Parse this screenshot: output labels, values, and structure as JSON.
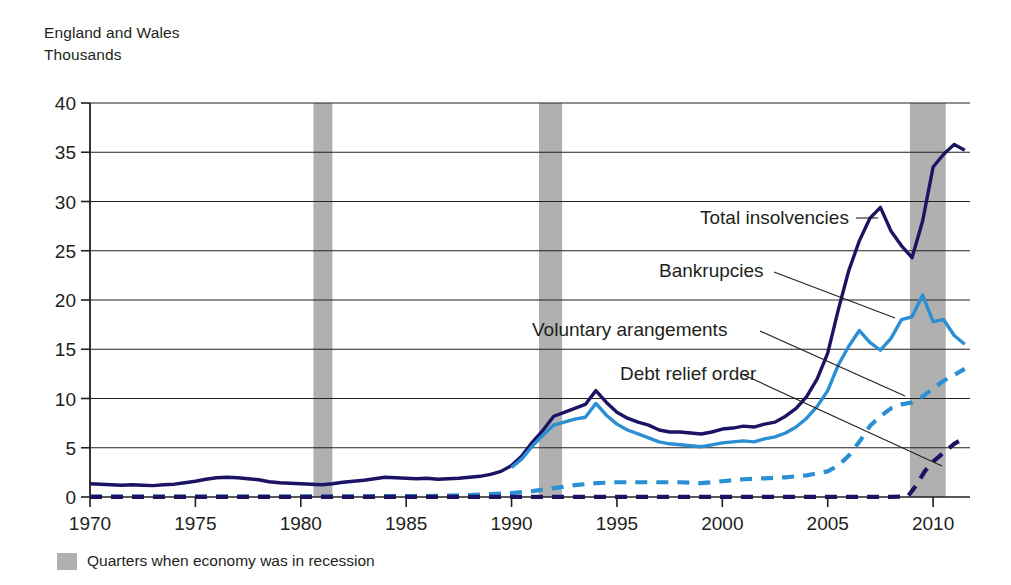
{
  "header": {
    "line1": "England and Wales",
    "line2": "Thousands"
  },
  "footer": {
    "legend_label": "Quarters when economy was in recession",
    "swatch_color": "#b0b0b0"
  },
  "colors": {
    "total_insolvencies": "#1b1464",
    "bankruptcies": "#2b8fd4",
    "voluntary_arrangements": "#2b8fd4",
    "debt_relief_order": "#1b1464",
    "recession_band": "#b0b0b0",
    "gridline": "#231f20",
    "axis": "#231f20",
    "leader_line": "#231f20"
  },
  "annotations": [
    {
      "name": "total-insolvencies",
      "text": "Total insolvencies",
      "x": 700,
      "y": 224,
      "lx1": 856,
      "ly1": 218,
      "lx2": 878,
      "ly2": 218
    },
    {
      "name": "bankrupcies",
      "text": "Bankrupcies",
      "x": 659,
      "y": 277,
      "lx1": 774,
      "ly1": 272,
      "lx2": 895,
      "ly2": 318
    },
    {
      "name": "voluntary-arangements",
      "text": "Voluntary arangements",
      "x": 532,
      "y": 336,
      "lx1": 760,
      "ly1": 331,
      "lx2": 905,
      "ly2": 396
    },
    {
      "name": "debt-relief-order",
      "text": "Debt relief order",
      "x": 620,
      "y": 380,
      "lx1": 744,
      "ly1": 375,
      "lx2": 942,
      "ly2": 466
    }
  ],
  "chart_data": {
    "type": "line",
    "title": "",
    "subtitle": "England and Wales, Thousands",
    "xlabel": "",
    "ylabel": "Thousands",
    "xlim": [
      1970,
      2011.75
    ],
    "ylim": [
      0,
      40
    ],
    "yticks": [
      0,
      5,
      10,
      15,
      20,
      25,
      30,
      35,
      40
    ],
    "xticks": [
      1970,
      1975,
      1980,
      1985,
      1990,
      1995,
      2000,
      2005,
      2010
    ],
    "grid": true,
    "legend_position": "inline-annotations",
    "recession_bands": [
      {
        "start": 1980.6,
        "end": 1981.5
      },
      {
        "start": 1991.3,
        "end": 1992.4
      },
      {
        "start": 2008.9,
        "end": 2010.6
      }
    ],
    "series": [
      {
        "name": "Total insolvencies",
        "color": "#1b1464",
        "style": "solid",
        "x": [
          1970,
          1970.5,
          1971,
          1971.5,
          1972,
          1972.5,
          1973,
          1973.5,
          1974,
          1974.5,
          1975,
          1975.5,
          1976,
          1976.5,
          1977,
          1977.5,
          1978,
          1978.5,
          1979,
          1979.5,
          1980,
          1980.5,
          1981,
          1981.5,
          1982,
          1982.5,
          1983,
          1983.5,
          1984,
          1984.5,
          1985,
          1985.5,
          1986,
          1986.5,
          1987,
          1987.5,
          1988,
          1988.5,
          1989,
          1989.5,
          1990,
          1990.5,
          1991,
          1991.5,
          1992,
          1992.5,
          1993,
          1993.5,
          1994,
          1994.5,
          1995,
          1995.5,
          1996,
          1996.5,
          1997,
          1997.5,
          1998,
          1998.5,
          1999,
          1999.5,
          2000,
          2000.5,
          2001,
          2001.5,
          2002,
          2002.5,
          2003,
          2003.5,
          2004,
          2004.5,
          2005,
          2005.5,
          2006,
          2006.5,
          2007,
          2007.5,
          2008,
          2008.5,
          2009,
          2009.5,
          2010,
          2010.5,
          2011,
          2011.5
        ],
        "values": [
          1.35,
          1.3,
          1.25,
          1.2,
          1.25,
          1.2,
          1.15,
          1.25,
          1.3,
          1.45,
          1.6,
          1.8,
          1.95,
          2.0,
          1.95,
          1.85,
          1.75,
          1.55,
          1.45,
          1.4,
          1.35,
          1.3,
          1.25,
          1.35,
          1.5,
          1.6,
          1.7,
          1.85,
          2.0,
          1.95,
          1.9,
          1.85,
          1.9,
          1.8,
          1.85,
          1.9,
          2.0,
          2.1,
          2.3,
          2.6,
          3.2,
          4.2,
          5.6,
          6.8,
          8.2,
          8.6,
          9.0,
          9.4,
          10.8,
          9.6,
          8.6,
          8.0,
          7.6,
          7.3,
          6.8,
          6.6,
          6.6,
          6.5,
          6.4,
          6.6,
          6.9,
          7.0,
          7.2,
          7.1,
          7.4,
          7.6,
          8.2,
          9.0,
          10.2,
          12.0,
          14.6,
          19.0,
          23.0,
          26.0,
          28.3,
          29.4,
          27.0,
          25.5,
          24.3,
          28.0,
          33.5,
          34.8,
          35.8,
          35.2
        ]
      },
      {
        "name": "Bankrupcies",
        "color": "#2b8fd4",
        "style": "solid",
        "x": [
          1990,
          1990.5,
          1991,
          1991.5,
          1992,
          1992.5,
          1993,
          1993.5,
          1994,
          1994.5,
          1995,
          1995.5,
          1996,
          1996.5,
          1997,
          1997.5,
          1998,
          1998.5,
          1999,
          1999.5,
          2000,
          2000.5,
          2001,
          2001.5,
          2002,
          2002.5,
          2003,
          2003.5,
          2004,
          2004.5,
          2005,
          2005.5,
          2006,
          2006.5,
          2007,
          2007.5,
          2008,
          2008.5,
          2009,
          2009.5,
          2010,
          2010.5,
          2011,
          2011.5
        ],
        "values": [
          3.0,
          3.9,
          5.2,
          6.3,
          7.3,
          7.6,
          7.9,
          8.1,
          9.5,
          8.3,
          7.4,
          6.8,
          6.4,
          6.0,
          5.6,
          5.4,
          5.3,
          5.2,
          5.1,
          5.3,
          5.5,
          5.6,
          5.7,
          5.6,
          5.9,
          6.1,
          6.5,
          7.1,
          8.0,
          9.2,
          10.8,
          13.4,
          15.3,
          16.9,
          15.7,
          14.9,
          16.1,
          18.0,
          18.3,
          20.5,
          17.8,
          18.0,
          16.4,
          15.5
        ]
      },
      {
        "name": "Voluntary arangements",
        "color": "#2b8fd4",
        "style": "dashed",
        "x": [
          1970,
          1980,
          1986,
          1987,
          1988,
          1989,
          1990,
          1991,
          1992,
          1993,
          1994,
          1995,
          1996,
          1997,
          1998,
          1999,
          2000,
          2001,
          2002,
          2003,
          2004,
          2005,
          2005.5,
          2006,
          2006.5,
          2007,
          2007.5,
          2008,
          2008.5,
          2009,
          2009.5,
          2010,
          2010.5,
          2011,
          2011.5
        ],
        "values": [
          0.05,
          0.05,
          0.1,
          0.15,
          0.2,
          0.3,
          0.4,
          0.6,
          0.9,
          1.2,
          1.4,
          1.5,
          1.5,
          1.5,
          1.5,
          1.4,
          1.6,
          1.8,
          1.9,
          2.0,
          2.2,
          2.6,
          3.2,
          4.2,
          5.6,
          7.2,
          8.2,
          9.0,
          9.4,
          9.6,
          10.2,
          11.0,
          11.8,
          12.4,
          13.0
        ]
      },
      {
        "name": "Debt relief order",
        "color": "#1b1464",
        "style": "dashed",
        "x": [
          1970,
          1990,
          2000,
          2005,
          2008,
          2008.8,
          2009.2,
          2009.6,
          2010,
          2010.5,
          2011,
          2011.5
        ],
        "values": [
          0.02,
          0.02,
          0.02,
          0.02,
          0.02,
          0.05,
          1.2,
          2.6,
          3.6,
          4.5,
          5.4,
          6.0
        ]
      }
    ]
  }
}
